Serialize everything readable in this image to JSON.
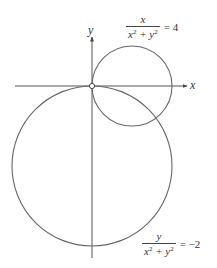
{
  "diagram": {
    "title": "",
    "axes": {
      "x_label": "x",
      "y_label": "y"
    },
    "curves": [
      {
        "name": "circle-x",
        "equation": {
          "numerator": "x",
          "denominator": "x",
          "denominator_plus": " + y",
          "exp": "2",
          "rhs": "= 4"
        },
        "center": [
          0.125,
          0
        ],
        "radius": 0.125
      },
      {
        "name": "circle-y",
        "equation": {
          "numerator": "y",
          "denominator": "x",
          "denominator_plus": " + y",
          "exp": "2",
          "rhs": "= −2"
        },
        "center": [
          0,
          -0.25
        ],
        "radius": 0.25
      }
    ],
    "origin_marker": "open-circle",
    "colors": {
      "stroke": "#555555",
      "text": "#333333",
      "background": "#ffffff"
    }
  }
}
